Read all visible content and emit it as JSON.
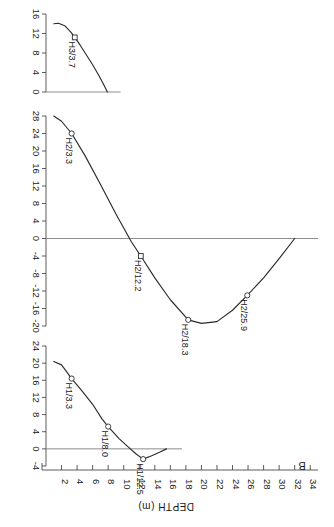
{
  "figure": {
    "panel_label": "B",
    "xlabel": "DEPTH (m)",
    "text_orientation": "rotated-180"
  },
  "chart_data": {
    "type": "line",
    "title": "",
    "xlabel": "DEPTH (m)",
    "ylabel": "",
    "xlim": [
      0,
      35
    ],
    "xticks": [
      2,
      4,
      6,
      8,
      10,
      12,
      14,
      16,
      18,
      20,
      22,
      24,
      26,
      28,
      30,
      32,
      34
    ],
    "grid": false,
    "legend": "none",
    "panels": [
      {
        "name": "H3",
        "ylim": [
          0,
          16
        ],
        "yticks": [
          0,
          4,
          8,
          12,
          16
        ],
        "x": [
          1.0,
          1.6,
          2.4,
          3.2,
          3.7,
          4.4,
          5.2,
          6.0,
          6.8,
          7.4,
          7.9
        ],
        "y": [
          14.0,
          14.1,
          13.6,
          12.3,
          11.2,
          9.6,
          7.6,
          5.6,
          3.4,
          1.6,
          0.0
        ],
        "annotations": [
          {
            "label": "H3/3.7",
            "x": 3.7,
            "y": 11.2,
            "marker": "square"
          }
        ]
      },
      {
        "name": "H2",
        "ylim": [
          -20,
          28
        ],
        "yticks": [
          -20,
          -16,
          -12,
          -8,
          -4,
          0,
          4,
          8,
          12,
          16,
          20,
          24,
          28
        ],
        "x": [
          1.0,
          2.0,
          3.3,
          5.0,
          7.0,
          9.0,
          11.0,
          12.2,
          14.0,
          16.0,
          18.3,
          20.0,
          22.0,
          24.0,
          25.9,
          28.0,
          30.0,
          32.0
        ],
        "y": [
          28.0,
          26.8,
          24.0,
          19.0,
          12.4,
          5.6,
          -0.8,
          -4.0,
          -9.0,
          -14.0,
          -18.6,
          -19.4,
          -19.0,
          -16.4,
          -13.0,
          -9.0,
          -4.6,
          0.0
        ],
        "annotations": [
          {
            "label": "H2/3.3",
            "x": 3.3,
            "y": 24.0,
            "marker": "circle"
          },
          {
            "label": "H2/12.2",
            "x": 12.2,
            "y": -4.0,
            "marker": "square"
          },
          {
            "label": "H2/18.3",
            "x": 18.3,
            "y": -18.6,
            "marker": "circle"
          },
          {
            "label": "H2/25.9",
            "x": 25.9,
            "y": -13.0,
            "marker": "circle"
          }
        ]
      },
      {
        "name": "H1",
        "ylim": [
          -4,
          24
        ],
        "yticks": [
          -4,
          0,
          4,
          8,
          12,
          16,
          20,
          24
        ],
        "x": [
          1.0,
          2.0,
          3.3,
          4.6,
          6.0,
          7.2,
          8.0,
          9.4,
          10.6,
          11.6,
          12.5,
          13.6,
          14.6,
          15.5
        ],
        "y": [
          20.4,
          19.6,
          16.4,
          13.6,
          10.4,
          7.0,
          5.2,
          2.4,
          0.4,
          -1.2,
          -2.4,
          -1.6,
          -0.8,
          0.0
        ],
        "annotations": [
          {
            "label": "H1/3.3",
            "x": 3.3,
            "y": 16.4,
            "marker": "circle"
          },
          {
            "label": "H1/8.0",
            "x": 8.0,
            "y": 5.2,
            "marker": "circle"
          },
          {
            "label": "H1/12.5",
            "x": 12.5,
            "y": -2.4,
            "marker": "circle"
          }
        ]
      }
    ]
  }
}
